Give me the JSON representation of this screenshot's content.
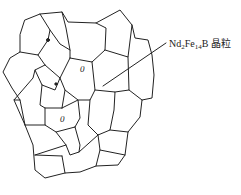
{
  "diagram": {
    "type": "grain-microstructure-sketch",
    "label": {
      "prefix": "Nd",
      "sub1": "2",
      "mid": "Fe",
      "sub2": "14",
      "suffix": "B 晶粒"
    },
    "label_full": "Nd2Fe14B 晶粒",
    "inclusions": [
      "0",
      "0"
    ],
    "colors": {
      "stroke": "#222222",
      "background": "#ffffff"
    }
  }
}
